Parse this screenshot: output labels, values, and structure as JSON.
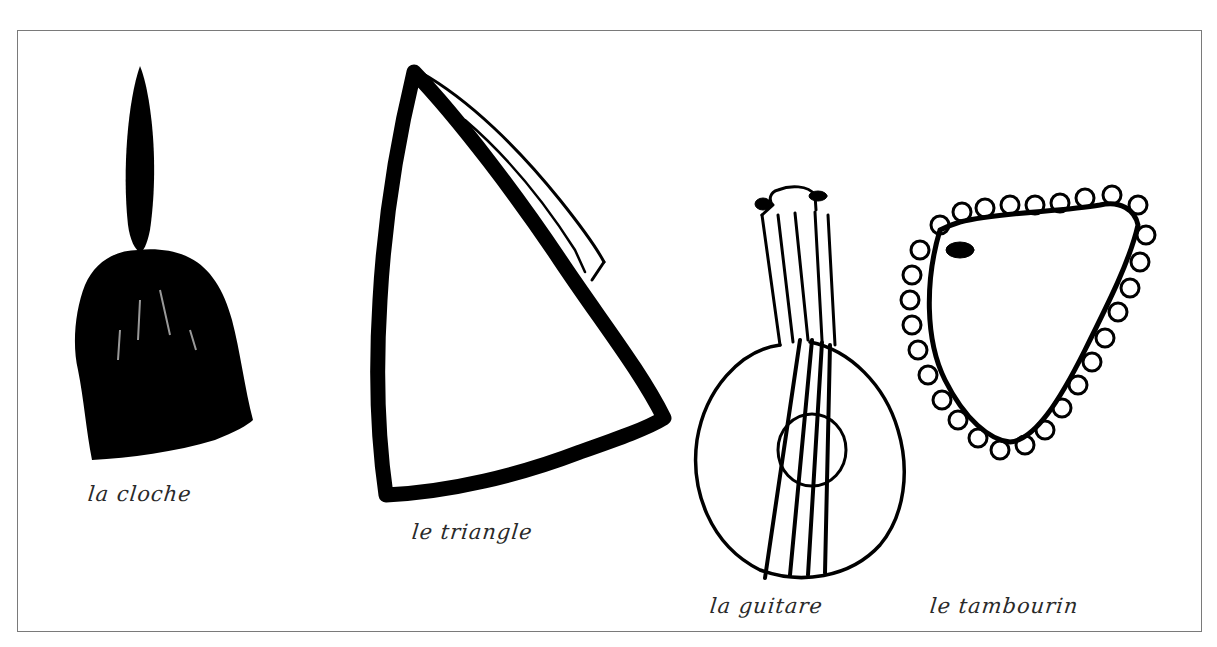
{
  "figure": {
    "items": [
      {
        "id": "bell",
        "caption": "la cloche"
      },
      {
        "id": "triangle",
        "caption": "le triangle"
      },
      {
        "id": "guitar",
        "caption": "la guitare"
      },
      {
        "id": "tambourine",
        "caption": "le tambourin"
      }
    ],
    "colors": {
      "ink": "#000000",
      "frame": "#7a7a7a",
      "paper": "#ffffff",
      "caption": "#2a2a2a"
    }
  }
}
